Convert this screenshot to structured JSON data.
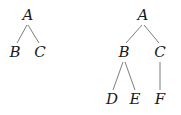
{
  "trees": [
    {
      "name": "tree-1",
      "nodes": [
        {
          "id": "A",
          "label": "A",
          "x": 28,
          "y": 20
        },
        {
          "id": "B",
          "label": "B",
          "x": 15,
          "y": 57
        },
        {
          "id": "C",
          "label": "C",
          "x": 40,
          "y": 57
        }
      ],
      "edges": [
        {
          "from": "A",
          "to": "B",
          "x1": 27,
          "y1": 25,
          "x2": 17,
          "y2": 43
        },
        {
          "from": "A",
          "to": "C",
          "x1": 28,
          "y1": 25,
          "x2": 39,
          "y2": 43
        }
      ]
    },
    {
      "name": "tree-2",
      "nodes": [
        {
          "id": "A",
          "label": "A",
          "x": 143,
          "y": 20
        },
        {
          "id": "B",
          "label": "B",
          "x": 124,
          "y": 57
        },
        {
          "id": "C",
          "label": "C",
          "x": 160,
          "y": 57
        },
        {
          "id": "D",
          "label": "D",
          "x": 112,
          "y": 104
        },
        {
          "id": "E",
          "label": "E",
          "x": 135,
          "y": 104
        },
        {
          "id": "F",
          "label": "F",
          "x": 160,
          "y": 104
        }
      ],
      "edges": [
        {
          "from": "A",
          "to": "B",
          "x1": 142,
          "y1": 25,
          "x2": 126,
          "y2": 43
        },
        {
          "from": "A",
          "to": "C",
          "x1": 144,
          "y1": 25,
          "x2": 159,
          "y2": 43
        },
        {
          "from": "B",
          "to": "D",
          "x1": 123,
          "y1": 62,
          "x2": 113,
          "y2": 90
        },
        {
          "from": "B",
          "to": "E",
          "x1": 125,
          "y1": 62,
          "x2": 135,
          "y2": 90
        },
        {
          "from": "C",
          "to": "F",
          "x1": 160,
          "y1": 62,
          "x2": 160,
          "y2": 90
        }
      ]
    }
  ]
}
